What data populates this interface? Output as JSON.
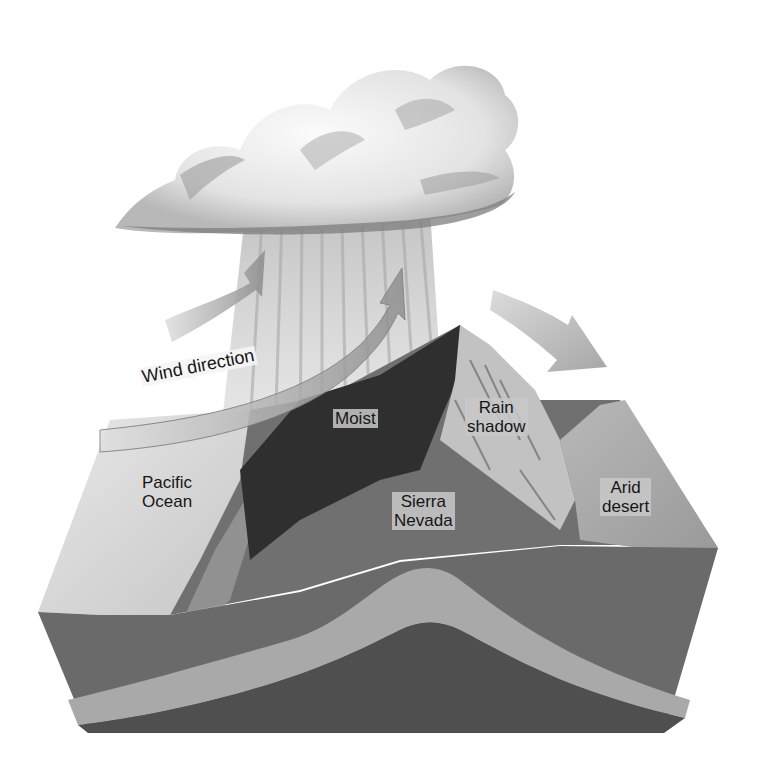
{
  "diagram": {
    "labels": {
      "wind_direction": "Wind direction",
      "moist": "Moist",
      "rain_shadow_line1": "Rain",
      "rain_shadow_line2": "shadow",
      "pacific_line1": "Pacific",
      "pacific_line2": "Ocean",
      "sierra_line1": "Sierra",
      "sierra_line2": "Nevada",
      "arid_line1": "Arid",
      "arid_line2": "desert"
    },
    "elements": {
      "cloud": "rain-cloud",
      "rain": "precipitation-streaks",
      "arrows": [
        "wind-arrow-upper-left",
        "wind-arrow-rising-over-mountain",
        "wind-arrow-descending-right"
      ],
      "landform": "block-diagram-mountain-cross-section"
    },
    "colors": {
      "background": "#ffffff",
      "cloud_light": "#f2f2f2",
      "cloud_dark": "#8a8a8a",
      "rain": "#c8c8c8",
      "arrow": "#9a9a9a",
      "moist_slope": "#2e2e2e",
      "rain_shadow_slope": "#bdbdbd",
      "ground": "#6e6e6e",
      "ocean": "#d6d6d6",
      "desert": "#a9a9a9",
      "rock_layer_light": "#a6a6a6",
      "rock_layer_dark": "#5a5a5a"
    }
  }
}
